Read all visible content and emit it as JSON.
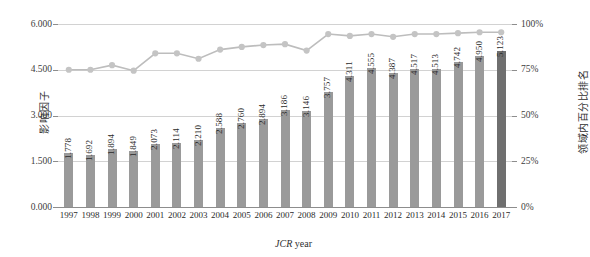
{
  "chart_data": {
    "type": "bar",
    "title": "",
    "subtitle": "",
    "xlabel": "JCR year",
    "ylabel": "影响因子",
    "y2label": "领域内百分比排名",
    "categories": [
      "1997",
      "1998",
      "1999",
      "2000",
      "2001",
      "2002",
      "2003",
      "2004",
      "2005",
      "2006",
      "2007",
      "2008",
      "2009",
      "2010",
      "2011",
      "2012",
      "2013",
      "2014",
      "2015",
      "2016",
      "2017"
    ],
    "ylim": [
      0,
      6
    ],
    "y2lim": [
      0,
      100
    ],
    "yticks": [
      "0.000",
      "1.500",
      "3.000",
      "4.500",
      "6.000"
    ],
    "ytick_values": [
      0,
      1.5,
      3.0,
      4.5,
      6.0
    ],
    "y2ticks": [
      "0%",
      "25%",
      "50%",
      "75%",
      "100%"
    ],
    "y2tick_values": [
      0,
      25,
      50,
      75,
      100
    ],
    "grid": true,
    "legend": "none",
    "series": [
      {
        "name": "影响因子",
        "type": "bar",
        "axis": "left",
        "color": "#9a9a9a",
        "highlight_color": "#6f6f6f",
        "highlight_index": 20,
        "values": [
          1.778,
          1.692,
          1.894,
          1.849,
          2.073,
          2.114,
          2.21,
          2.588,
          2.76,
          2.894,
          3.186,
          3.146,
          3.757,
          4.311,
          4.555,
          4.387,
          4.517,
          4.513,
          4.742,
          4.95,
          5.123
        ],
        "labels": [
          "1.778",
          "1.692",
          "1.894",
          "1.849",
          "2.073",
          "2.114",
          "2.210",
          "2.588",
          "2.760",
          "2.894",
          "3.186",
          "3.146",
          "3.757",
          "4.311",
          "4.555",
          "4.387",
          "4.517",
          "4.513",
          "4.742",
          "4.950",
          "5.123"
        ]
      },
      {
        "name": "领域内百分比排名",
        "type": "line",
        "axis": "right",
        "color": "#bdbdbd",
        "marker_color": "#c4c4c4",
        "values": [
          75.0,
          75.0,
          77.5,
          74.5,
          84.0,
          84.0,
          81.0,
          86.0,
          87.5,
          88.5,
          89.0,
          85.5,
          94.5,
          93.5,
          94.5,
          93.0,
          94.5,
          94.5,
          95.0,
          95.5,
          95.5
        ]
      }
    ]
  },
  "axes": {
    "left_title": "影响因子",
    "right_title": "领域内百分比排名",
    "x_title_italic": "JCR",
    "x_title_rest": " year"
  }
}
